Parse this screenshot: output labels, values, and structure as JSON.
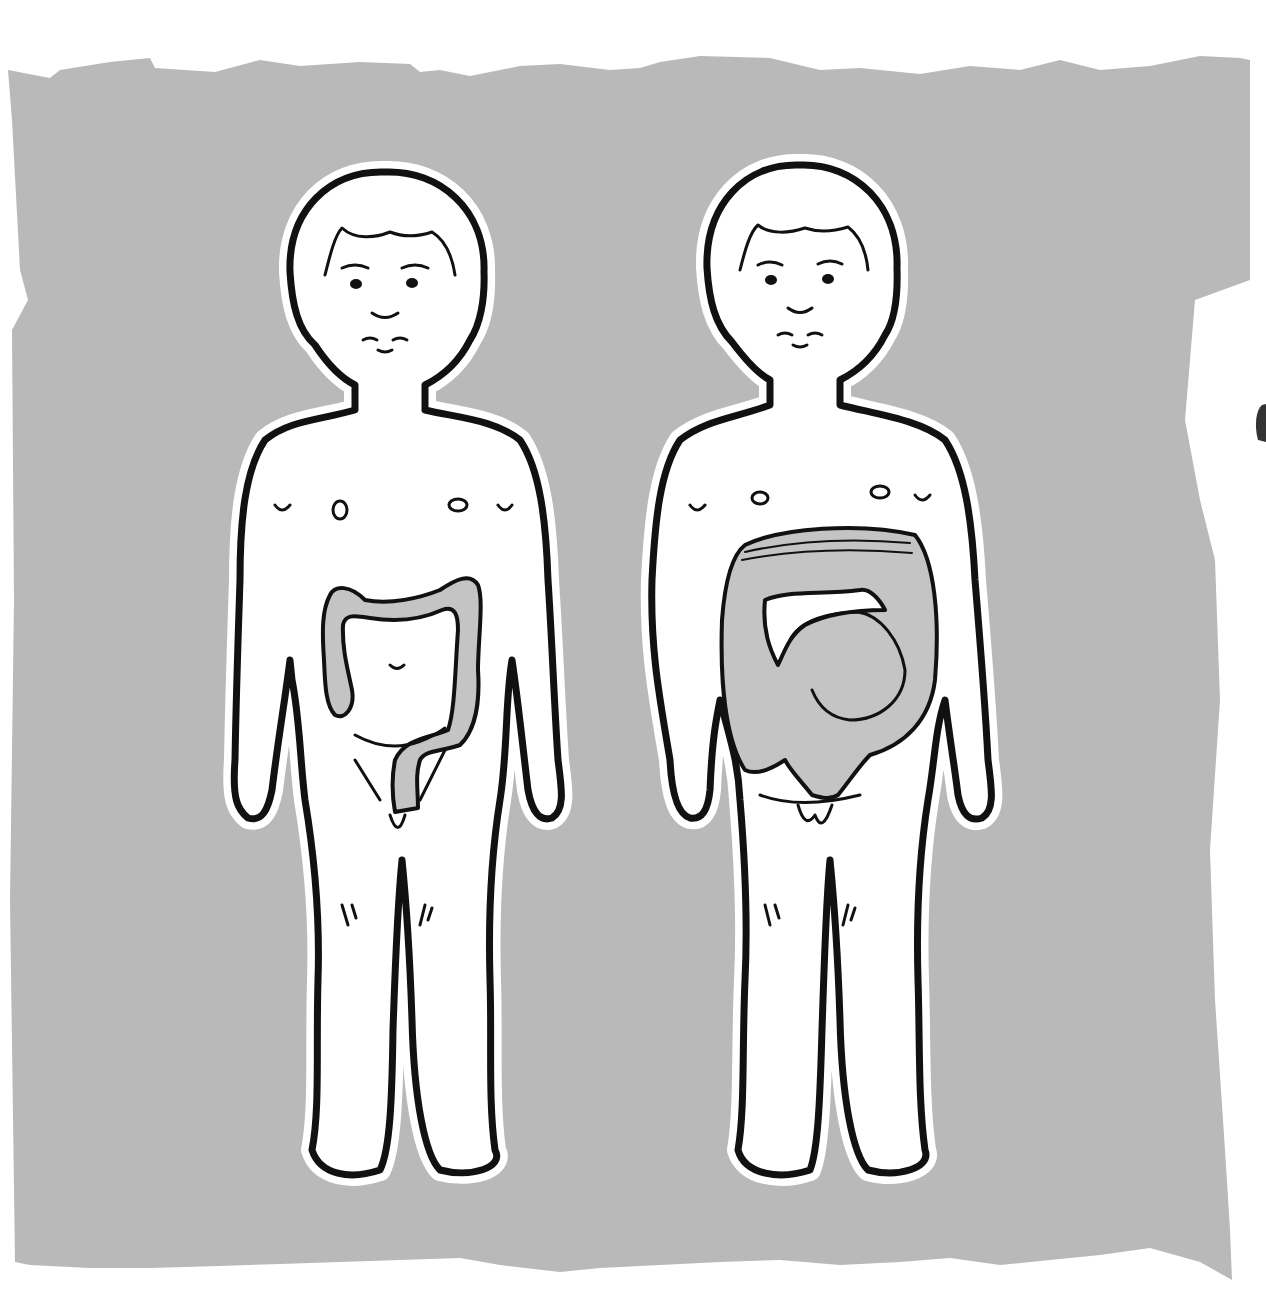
{
  "illustration": {
    "subject": "Two child figures comparing abdominal colon",
    "background_color": "#b9b9b9",
    "organ_color": "#c4c4c4",
    "outline_color": "#111111",
    "figures": [
      {
        "position": "left",
        "depiction": "normal-sized colon"
      },
      {
        "position": "right",
        "depiction": "greatly enlarged, distended colon"
      }
    ]
  }
}
